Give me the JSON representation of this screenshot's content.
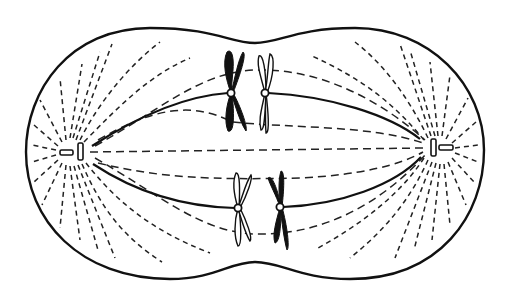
{
  "diagram": {
    "title": "Mitotic spindle with paired chromosomes at metaphase plate",
    "colors": {
      "line": "#111111",
      "background": "#ffffff",
      "chromosome_dark": "#111111",
      "chromosome_light": "#ffffff"
    },
    "cell_outline": {
      "shape": "peanut",
      "left_x": 26,
      "right_x": 484,
      "top_y": 28,
      "bottom_y": 279,
      "pinch_top": {
        "x": 255,
        "y": 43
      },
      "pinch_bottom": {
        "x": 255,
        "y": 262
      }
    },
    "poles": [
      {
        "name": "left-centrosome",
        "x": 72,
        "y": 152
      },
      {
        "name": "right-centrosome",
        "x": 440,
        "y": 148
      }
    ],
    "chromosome_pairs": [
      {
        "position": "upper",
        "kinetochores": [
          {
            "x": 231,
            "y": 93,
            "shade": "dark"
          },
          {
            "x": 265,
            "y": 93,
            "shade": "light"
          }
        ]
      },
      {
        "position": "lower",
        "kinetochores": [
          {
            "x": 238,
            "y": 208,
            "shade": "light"
          },
          {
            "x": 280,
            "y": 207,
            "shade": "dark"
          }
        ]
      }
    ],
    "fiber_types": [
      "kinetochore-microtubule",
      "polar-microtubule",
      "astral-microtubule"
    ]
  }
}
